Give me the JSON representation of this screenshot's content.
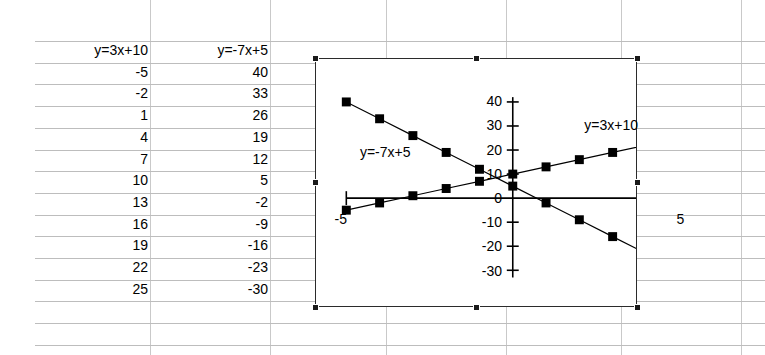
{
  "spreadsheet": {
    "columns": [
      {
        "header": "y=3x+10",
        "values": [
          "-5",
          "-2",
          "1",
          "4",
          "7",
          "10",
          "13",
          "16",
          "19",
          "22",
          "25"
        ]
      },
      {
        "header": "y=-7x+5",
        "values": [
          "40",
          "33",
          "26",
          "19",
          "12",
          "5",
          "-2",
          "-9",
          "-16",
          "-23",
          "-30"
        ]
      }
    ]
  },
  "chart_object": {
    "selected": true,
    "handle_name": "selection-handle"
  },
  "chart_data": {
    "type": "scatter",
    "title": "",
    "xlabel": "",
    "ylabel": "",
    "xlim": [
      -5,
      5
    ],
    "ylim": [
      -35,
      42
    ],
    "grid": false,
    "legend_position": "inline-annotations",
    "x_tick_labels": [
      "-5",
      "5"
    ],
    "x_ticks": [
      -5,
      5
    ],
    "y_tick_labels": [
      "40",
      "30",
      "20",
      "10",
      "0",
      "-10",
      "-20",
      "-30"
    ],
    "y_ticks": [
      40,
      30,
      20,
      10,
      0,
      -10,
      -20,
      -30
    ],
    "x": [
      -5,
      -4,
      -3,
      -2,
      -1,
      0,
      1,
      2,
      3,
      4,
      5
    ],
    "series": [
      {
        "name": "y=3x+10",
        "annotation": "y=3x+10",
        "annotation_x": 2.1,
        "annotation_y": 30,
        "marker": "filled-square",
        "color": "#000000",
        "values": [
          -5,
          -2,
          1,
          4,
          7,
          10,
          13,
          16,
          19,
          22,
          25
        ]
      },
      {
        "name": "y=-7x+5",
        "annotation": "y=-7x+5",
        "annotation_x": -4.6,
        "annotation_y": 19,
        "marker": "filled-square",
        "color": "#000000",
        "values": [
          40,
          33,
          26,
          19,
          12,
          5,
          -2,
          -9,
          -16,
          -23,
          -30
        ]
      }
    ]
  }
}
